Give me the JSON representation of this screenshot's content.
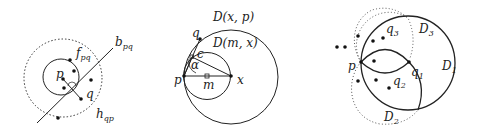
{
  "panels": [
    {
      "id": "panel-1",
      "labels": {
        "f": "f",
        "f_sub": "pq",
        "b": "b",
        "b_sub": "pq",
        "h": "h",
        "h_sub": "qp",
        "p": "p",
        "q": "q"
      }
    },
    {
      "id": "panel-2",
      "labels": {
        "Dxp": "D(x, p)",
        "Dmx": "D(m, x)",
        "q": "q",
        "c": "c",
        "alpha": "α",
        "p": "p",
        "m": "m",
        "x": "x"
      }
    },
    {
      "id": "panel-3",
      "labels": {
        "q3": "q",
        "q3_sub": "3",
        "D3": "D",
        "D3_sub": "3",
        "p": "p",
        "q1": "q",
        "q1_sub": "1",
        "D1": "D",
        "D1_sub": "1",
        "q2": "q",
        "q2_sub": "2",
        "D2": "D",
        "D2_sub": "2"
      }
    }
  ],
  "colors": {
    "stroke": "#222222",
    "background": "#ffffff"
  }
}
